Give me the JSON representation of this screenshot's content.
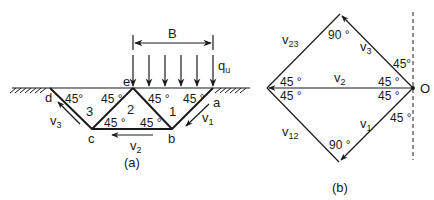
{
  "figure_a": {
    "caption": "(a)",
    "width_label": "B",
    "load_label": "q",
    "load_sub": "u",
    "points": {
      "a": "a",
      "b": "b",
      "c": "c",
      "d": "d",
      "e": "e"
    },
    "zones": {
      "z1": "1",
      "z2": "2",
      "z3": "3"
    },
    "angles": {
      "d_top": "45°",
      "e_left": "45 °",
      "e_right": "45 °",
      "a_left": "45 °",
      "c_right": "45 °",
      "b_left": "45 °"
    },
    "velocities": {
      "v1": {
        "base": "v",
        "sub": "1"
      },
      "v2": {
        "base": "v",
        "sub": "2"
      },
      "v3": {
        "base": "v",
        "sub": "3"
      }
    }
  },
  "figure_b": {
    "caption": "(b)",
    "origin_label": "O",
    "angles": {
      "top": "90 °",
      "bottom": "90 °",
      "left_upper": "45 °",
      "left_lower": "45 °",
      "o_upper": "45 °",
      "o_lower": "45 °",
      "o_v3_dash": "45°",
      "o_v1_dash": "45 °"
    },
    "velocities": {
      "v23": {
        "base": "v",
        "sub": "23"
      },
      "v3": {
        "base": "v",
        "sub": "3"
      },
      "v2": {
        "base": "v",
        "sub": "2"
      },
      "v12": {
        "base": "v",
        "sub": "12"
      },
      "v1": {
        "base": "v",
        "sub": "1"
      }
    }
  }
}
